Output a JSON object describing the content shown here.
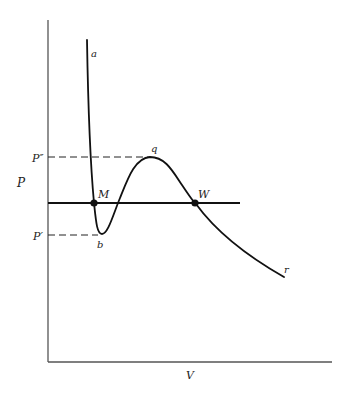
{
  "diagram": {
    "type": "pv-isotherm",
    "axes": {
      "x_label": "V",
      "y_label": "P"
    },
    "pressure_levels": {
      "upper": "P″",
      "lower": "P′"
    },
    "curve_labels": {
      "start": "a",
      "minimum": "b",
      "maximum": "q",
      "end": "r"
    },
    "points": {
      "left_intersection": "M",
      "right_intersection": "W"
    }
  }
}
